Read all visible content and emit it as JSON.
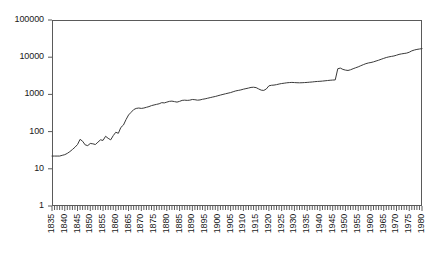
{
  "chart_data": {
    "type": "line",
    "title": "",
    "subtitle": "",
    "xlabel": "",
    "ylabel": "",
    "yscale": "log",
    "xlim": [
      1835,
      1980
    ],
    "ylim": [
      1,
      100000
    ],
    "grid": false,
    "legend": null,
    "y_tick_labels": [
      "100000",
      "10000",
      "1000",
      "100",
      "10",
      "1"
    ],
    "y_tick_values": [
      100000,
      10000,
      1000,
      100,
      10,
      1
    ],
    "x_tick_labels": [
      "1835",
      "1840",
      "1845",
      "1850",
      "1855",
      "1860",
      "1865",
      "1870",
      "1875",
      "1880",
      "1885",
      "1890",
      "1895",
      "1900",
      "1905",
      "1910",
      "1915",
      "1920",
      "1925",
      "1930",
      "1935",
      "1940",
      "1945",
      "1950",
      "1955",
      "1960",
      "1965",
      "1970",
      "1975",
      "1980"
    ],
    "x_tick_values": [
      1835,
      1840,
      1845,
      1850,
      1855,
      1860,
      1865,
      1870,
      1875,
      1880,
      1885,
      1890,
      1895,
      1900,
      1905,
      1910,
      1915,
      1920,
      1925,
      1930,
      1935,
      1940,
      1945,
      1950,
      1955,
      1960,
      1965,
      1970,
      1975,
      1980
    ],
    "x_minor_tick_interval": 1,
    "line_color": "#3a3a3a",
    "axis_color": "#5a5a5a",
    "series": [
      {
        "name": "series-1",
        "x": [
          1835,
          1836,
          1837,
          1838,
          1839,
          1840,
          1841,
          1842,
          1843,
          1844,
          1845,
          1846,
          1847,
          1848,
          1849,
          1850,
          1851,
          1852,
          1853,
          1854,
          1855,
          1856,
          1857,
          1858,
          1859,
          1860,
          1861,
          1862,
          1863,
          1864,
          1865,
          1866,
          1867,
          1868,
          1869,
          1870,
          1871,
          1872,
          1873,
          1874,
          1875,
          1876,
          1877,
          1878,
          1879,
          1880,
          1881,
          1882,
          1883,
          1884,
          1885,
          1886,
          1887,
          1888,
          1889,
          1890,
          1891,
          1892,
          1893,
          1894,
          1895,
          1896,
          1897,
          1898,
          1899,
          1900,
          1901,
          1902,
          1903,
          1904,
          1905,
          1906,
          1907,
          1908,
          1909,
          1910,
          1911,
          1912,
          1913,
          1914,
          1915,
          1916,
          1917,
          1918,
          1919,
          1920,
          1921,
          1922,
          1923,
          1924,
          1925,
          1926,
          1927,
          1928,
          1929,
          1930,
          1931,
          1932,
          1933,
          1934,
          1935,
          1936,
          1937,
          1938,
          1939,
          1940,
          1941,
          1942,
          1943,
          1944,
          1945,
          1946,
          1947,
          1948,
          1949,
          1950,
          1951,
          1952,
          1953,
          1954,
          1955,
          1956,
          1957,
          1958,
          1959,
          1960,
          1961,
          1962,
          1963,
          1964,
          1965,
          1966,
          1967,
          1968,
          1969,
          1970,
          1971,
          1972,
          1973,
          1974,
          1975,
          1976,
          1977,
          1978,
          1979,
          1980
        ],
        "y": [
          22,
          22,
          22,
          22,
          23,
          24,
          26,
          29,
          33,
          38,
          45,
          62,
          55,
          44,
          42,
          48,
          47,
          45,
          52,
          60,
          58,
          75,
          66,
          60,
          78,
          96,
          90,
          130,
          150,
          210,
          280,
          330,
          390,
          420,
          430,
          420,
          430,
          450,
          470,
          500,
          520,
          540,
          560,
          600,
          590,
          620,
          650,
          660,
          640,
          620,
          650,
          690,
          700,
          690,
          700,
          730,
          720,
          700,
          710,
          740,
          760,
          790,
          820,
          850,
          880,
          920,
          960,
          1000,
          1040,
          1080,
          1120,
          1180,
          1240,
          1280,
          1320,
          1380,
          1430,
          1480,
          1540,
          1560,
          1520,
          1400,
          1300,
          1280,
          1400,
          1700,
          1760,
          1780,
          1830,
          1900,
          1960,
          2000,
          2050,
          2080,
          2100,
          2080,
          2060,
          2050,
          2060,
          2080,
          2100,
          2130,
          2160,
          2200,
          2230,
          2250,
          2280,
          2320,
          2360,
          2400,
          2430,
          2450,
          4900,
          5100,
          4700,
          4500,
          4400,
          4600,
          4900,
          5200,
          5500,
          5900,
          6300,
          6700,
          7000,
          7200,
          7500,
          7900,
          8300,
          8800,
          9300,
          9800,
          10200,
          10500,
          10800,
          11300,
          11900,
          12300,
          12600,
          12900,
          13600,
          14800,
          15600,
          16200,
          16600,
          17000
        ]
      }
    ]
  }
}
